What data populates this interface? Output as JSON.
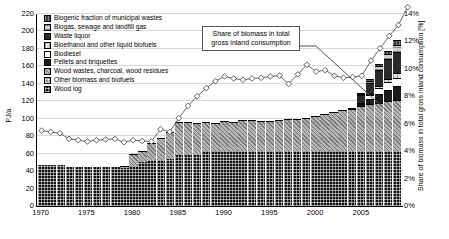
{
  "chart_data": {
    "type": "bar",
    "title": "",
    "xlabel": "",
    "ylabel": "PJ/a",
    "y2label": "Share of biomass in total gross inland consumption [%]",
    "ylim": [
      0,
      220
    ],
    "y2lim": [
      0,
      14
    ],
    "grid": true,
    "legend_position": "top-left",
    "annotation": "Share of biomass in total gross inland consumption",
    "yticks": [
      "0",
      "20",
      "40",
      "60",
      "80",
      "100",
      "120",
      "140",
      "160",
      "180",
      "200",
      "220"
    ],
    "y2ticks": [
      "0%",
      "2%",
      "4%",
      "6%",
      "8%",
      "10%",
      "12%",
      "14%"
    ],
    "categories": [
      1970,
      1971,
      1972,
      1973,
      1974,
      1975,
      1976,
      1977,
      1978,
      1979,
      1980,
      1981,
      1982,
      1983,
      1984,
      1985,
      1986,
      1987,
      1988,
      1989,
      1990,
      1991,
      1992,
      1993,
      1994,
      1995,
      1996,
      1997,
      1998,
      1999,
      2000,
      2001,
      2002,
      2003,
      2004,
      2005,
      2006,
      2007,
      2008,
      2009
    ],
    "xtick_labels": [
      "1970",
      "1975",
      "1980",
      "1985",
      "1990",
      "1995",
      "2000",
      "2005"
    ],
    "series": [
      {
        "name": "Wood log",
        "values": [
          47,
          47,
          47,
          45,
          45,
          45,
          45,
          45,
          45,
          44,
          46,
          50,
          53,
          53,
          54,
          58,
          58,
          60,
          63,
          63,
          63,
          63,
          63,
          63,
          63,
          63,
          63,
          63,
          63,
          63,
          63,
          63,
          63,
          63,
          63,
          63,
          63,
          63,
          63,
          63
        ]
      },
      {
        "name": "Other biomass and biofuels",
        "values": [
          0,
          0,
          0,
          0,
          0,
          0,
          0,
          0,
          0,
          0,
          0,
          0,
          0,
          0,
          0,
          0,
          0,
          0,
          0,
          0,
          0,
          0,
          0,
          0,
          0,
          0,
          0,
          0,
          0,
          0,
          0,
          0,
          0,
          0,
          0,
          0,
          0,
          0,
          0,
          0
        ]
      },
      {
        "name": "Wood wastes, charcoal, wood residues",
        "values": [
          0,
          0,
          0,
          0,
          0,
          0,
          0,
          0,
          0,
          2,
          14,
          13,
          19,
          25,
          31,
          38,
          38,
          35,
          33,
          32,
          35,
          33,
          36,
          36,
          35,
          34,
          36,
          37,
          37,
          38,
          40,
          42,
          45,
          47,
          48,
          52,
          54,
          55,
          57,
          58
        ]
      },
      {
        "name": "Pellets and briquettes",
        "values": [
          0,
          0,
          0,
          0,
          0,
          0,
          0,
          0,
          0,
          0,
          0,
          0,
          0,
          0,
          0,
          0,
          0,
          0,
          0,
          0,
          0,
          0,
          0,
          0,
          0,
          0,
          0,
          0,
          0,
          0,
          0,
          0,
          0,
          0,
          0,
          2,
          6,
          10,
          13,
          16
        ]
      },
      {
        "name": "Biodiesel",
        "values": [
          0,
          0,
          0,
          0,
          0,
          0,
          0,
          0,
          0,
          0,
          0,
          0,
          0,
          0,
          0,
          0,
          0,
          0,
          0,
          0,
          0,
          0,
          0,
          0,
          0,
          0,
          0,
          0,
          0,
          0,
          0,
          0,
          0,
          0,
          0,
          1,
          4,
          7,
          9,
          10
        ]
      },
      {
        "name": "Bioethanol and other liquid biofuels",
        "values": [
          0,
          0,
          0,
          0,
          0,
          0,
          0,
          0,
          0,
          0,
          0,
          0,
          0,
          0,
          0,
          0,
          0,
          0,
          0,
          0,
          0,
          0,
          0,
          0,
          0,
          0,
          0,
          0,
          0,
          0,
          0,
          0,
          0,
          0,
          0,
          0,
          1,
          3,
          4,
          5
        ]
      },
      {
        "name": "Waste liquor",
        "values": [
          0,
          0,
          0,
          0,
          0,
          0,
          0,
          0,
          0,
          0,
          0,
          0,
          0,
          0,
          0,
          0,
          0,
          0,
          0,
          0,
          0,
          0,
          0,
          0,
          0,
          0,
          0,
          0,
          0,
          0,
          0,
          0,
          0,
          0,
          1,
          9,
          13,
          18,
          22,
          25
        ]
      },
      {
        "name": "Biogas, sewage and landfill gas",
        "values": [
          0,
          0,
          0,
          0,
          0,
          0,
          0,
          0,
          0,
          0,
          0,
          0,
          0,
          0,
          0,
          0,
          0,
          0,
          0,
          0,
          0,
          0,
          0,
          0,
          0,
          0,
          0,
          0,
          0,
          0,
          0,
          0,
          0,
          0,
          0,
          1,
          2,
          4,
          6,
          8
        ]
      },
      {
        "name": "Biogenic fraction of municipal wastes",
        "values": [
          0,
          0,
          0,
          0,
          0,
          0,
          0,
          0,
          0,
          0,
          0,
          0,
          0,
          0,
          0,
          0,
          0,
          0,
          0,
          0,
          0,
          0,
          0,
          0,
          0,
          0,
          0,
          0,
          0,
          0,
          0,
          0,
          0,
          0,
          0,
          1,
          2,
          3,
          4,
          5
        ]
      }
    ],
    "line_series": {
      "name": "Share of biomass in total gross inland consumption",
      "unit": "%",
      "values": [
        5.5,
        5.4,
        5.3,
        4.9,
        4.8,
        4.7,
        4.8,
        4.85,
        4.9,
        4.65,
        4.8,
        4.75,
        4.7,
        5.6,
        5.4,
        6.4,
        7.3,
        8.0,
        8.6,
        9.1,
        9.45,
        9.3,
        9.2,
        9.3,
        9.35,
        9.45,
        9.5,
        8.9,
        9.6,
        10.3,
        9.8,
        9.9,
        9.5,
        9.35,
        9.4,
        9.5,
        10.6,
        11.5,
        12.4,
        13.2,
        14.5
      ]
    }
  },
  "legend": {
    "items": [
      {
        "label": "Biogenic fraction of municipal wastes",
        "swatch": "municipal"
      },
      {
        "label": "Biogas, sewage and landfill gas",
        "swatch": "biogas"
      },
      {
        "label": "Waste liquor",
        "swatch": "wasteliquor"
      },
      {
        "label": "Bioethanol and other liquid biofuels",
        "swatch": "bioethanol"
      },
      {
        "label": "Biodiesel",
        "swatch": "biodiesel"
      },
      {
        "label": "Pellets and briquettes",
        "swatch": "pellets"
      },
      {
        "label": "Wood wastes, charcoal, wood residues",
        "swatch": "woodwaste"
      },
      {
        "label": "Other biomass and biofuels",
        "swatch": "other"
      },
      {
        "label": "Wood log",
        "swatch": "woodlog"
      }
    ]
  }
}
